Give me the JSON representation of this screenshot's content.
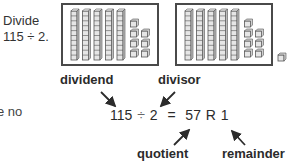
{
  "prompt": {
    "line1": "Divide",
    "line2": "115 ÷ 2."
  },
  "cropped_text": "e no",
  "model": {
    "groups": [
      {
        "tens_rods": 5,
        "ones_cubes": 7
      },
      {
        "tens_rods": 5,
        "ones_cubes": 7
      }
    ],
    "remainder_cubes": 1
  },
  "labels": {
    "dividend": "dividend",
    "divisor": "divisor",
    "quotient": "quotient",
    "remainder": "remainder"
  },
  "equation": {
    "dividend": "115",
    "op": "÷",
    "divisor": "2",
    "equals": "=",
    "quotient": "57",
    "r": "R",
    "remainder": "1"
  },
  "colors": {
    "ink": "#2b2b2b",
    "block_stroke": "#555555",
    "block_fill": "#e6e6e6"
  }
}
